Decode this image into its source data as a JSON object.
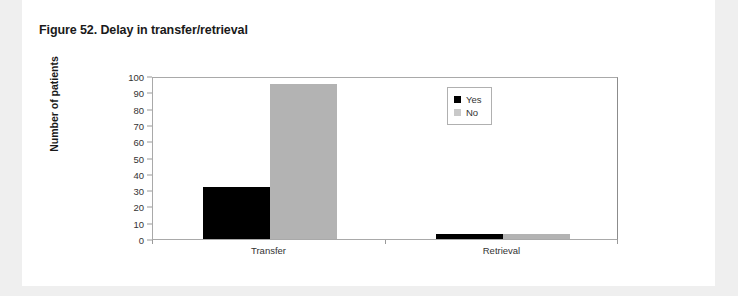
{
  "figure": {
    "title": "Figure 52. Delay in transfer/retrieval"
  },
  "chart_data": {
    "type": "bar",
    "title": "Figure 52. Delay in transfer/retrieval",
    "xlabel": "",
    "ylabel": "Number of patients",
    "categories": [
      "Transfer",
      "Retrieval"
    ],
    "series": [
      {
        "name": "Yes",
        "color": "#000000",
        "values": [
          32,
          3
        ]
      },
      {
        "name": "No",
        "color": "#b3b3b3",
        "values": [
          95,
          3
        ]
      }
    ],
    "ylim": [
      0,
      100
    ],
    "yticks": [
      0,
      10,
      20,
      30,
      40,
      50,
      60,
      70,
      80,
      90,
      100
    ],
    "ytick_labels": [
      "0",
      "10",
      "20",
      "30",
      "40",
      "50",
      "60",
      "70",
      "80",
      "90",
      "100"
    ],
    "grid": false,
    "legend_position": "top-right",
    "legend_entries": [
      "Yes",
      "No"
    ]
  }
}
